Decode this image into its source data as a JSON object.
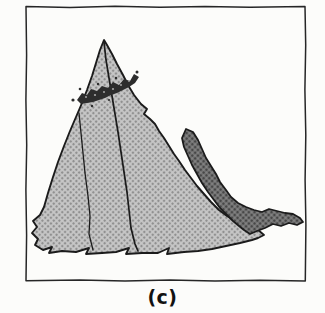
{
  "figure": {
    "label": "(c)"
  },
  "illustration": {
    "elements": [
      "frame-border",
      "mountain-body",
      "left-fold-line",
      "central-ridge-line",
      "shaded-ridge",
      "summit-rock-band"
    ]
  },
  "colors": {
    "background": "#fcfcfa",
    "frame_stroke": "#262626",
    "outline": "#1b1b1b",
    "halftone_light_bg": "#c7c7c7",
    "halftone_light_dot": "#909090",
    "halftone_dark_bg": "#828282",
    "halftone_dark_dot": "#474747",
    "rock_band": "#2d2d2d",
    "rock_band_speckle": "#a6a6a6",
    "label_color": "#111111"
  }
}
